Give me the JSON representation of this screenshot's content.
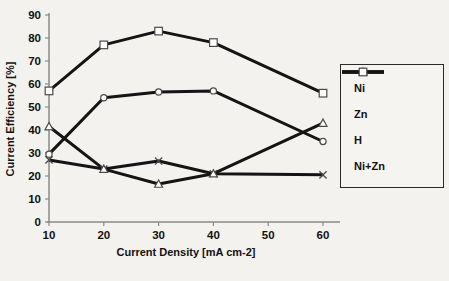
{
  "figure": {
    "background": "#f4f2ef",
    "line_color": "#141414",
    "marker_fill": "#ffffff",
    "marker_stroke": "#4a4a4a"
  },
  "chart_data": {
    "type": "line",
    "title": "",
    "xlabel": "Current Density [mA cm-2]",
    "ylabel": "Current Efficiency [%]",
    "x": [
      10,
      20,
      30,
      40,
      60
    ],
    "x_ticks": [
      10,
      20,
      30,
      40,
      50,
      60
    ],
    "y_ticks": [
      0,
      10,
      20,
      30,
      40,
      50,
      60,
      70,
      80,
      90
    ],
    "xlim": [
      10,
      60
    ],
    "ylim": [
      0,
      90
    ],
    "grid": false,
    "legend_position": "right",
    "series": [
      {
        "name": "Ni",
        "marker": "x",
        "values": [
          27,
          23,
          26.5,
          21,
          20.5
        ]
      },
      {
        "name": "Zn",
        "marker": "circle",
        "values": [
          29.5,
          54,
          56.5,
          57,
          35
        ]
      },
      {
        "name": "H",
        "marker": "triangle",
        "values": [
          41.5,
          23,
          16.5,
          21,
          43
        ]
      },
      {
        "name": "Ni+Zn",
        "marker": "square",
        "values": [
          57,
          77,
          83,
          78,
          56
        ]
      }
    ]
  }
}
